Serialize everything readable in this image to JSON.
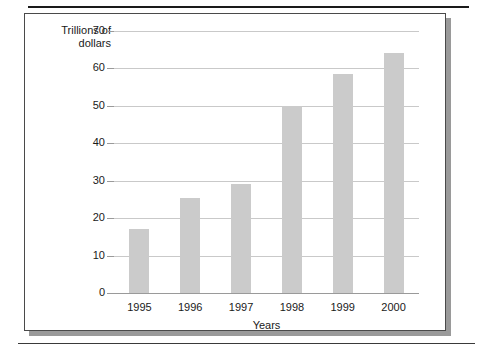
{
  "figure": {
    "frame_border_color": "#4a4a4a",
    "shadow_color": "#9a9a9a",
    "background": "#ffffff"
  },
  "chart_data": {
    "type": "bar",
    "title": "",
    "subtitle": "",
    "categories": [
      "1995",
      "1996",
      "1997",
      "1998",
      "1999",
      "2000"
    ],
    "values": [
      17,
      25.5,
      29,
      50,
      58.5,
      64
    ],
    "series": [
      {
        "name": "Trillions of dollars",
        "values": [
          17,
          25.5,
          29,
          50,
          58.5,
          64
        ]
      }
    ],
    "xlabel": "Years",
    "ylabel": "Trillions of\ndollars",
    "ylabel_line1": "Trillions of",
    "ylabel_line2": "dollars",
    "ylim": [
      0,
      70
    ],
    "yticks": [
      0,
      10,
      20,
      30,
      40,
      50,
      60,
      70
    ],
    "ytick_labels": [
      "0",
      "10",
      "20",
      "30",
      "40",
      "50",
      "60",
      "70"
    ],
    "grid": true,
    "grid_axis": "y",
    "grid_color": "#c9c9c9",
    "bar_color": "#cbcbcb",
    "axis_color": "#9a9a9a",
    "legend": false,
    "legend_position": "none",
    "annotations": []
  }
}
